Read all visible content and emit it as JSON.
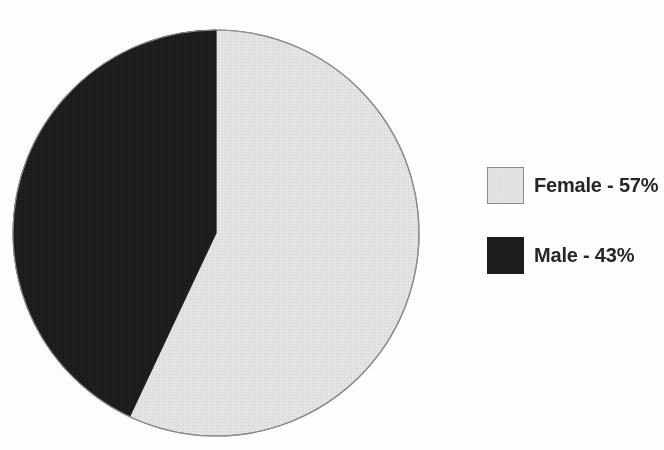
{
  "chart_data": {
    "type": "pie",
    "title": "Gender of Offenders",
    "xlabel": "",
    "ylabel": "",
    "grid": false,
    "legend_position": "right",
    "units": "percent",
    "start_angle_deg": 0,
    "direction": "clockwise",
    "categories": [
      "Female",
      "Male"
    ],
    "values": [
      57,
      43
    ],
    "slices": [
      {
        "label": "Female",
        "value": 57,
        "value_text": "57%",
        "legend_text": "Female - 57%",
        "color": "#e3e3e3",
        "border_color": "#8d8d8d",
        "start_angle_deg": 0,
        "end_angle_deg": 205.2
      },
      {
        "label": "Male",
        "value": 43,
        "value_text": "43%",
        "legend_text": "Male - 43%",
        "color": "#1d1d1d",
        "border_color": "#1d1d1d",
        "start_angle_deg": 205.2,
        "end_angle_deg": 360
      }
    ]
  },
  "figure": {
    "background": "#ffffff",
    "title": "Gender of Offenders"
  },
  "pie": {
    "center_x": 204,
    "center_y": 204,
    "radius": 203,
    "outline_color": "#8d8d8d"
  },
  "legend": {
    "items": [
      {
        "label": "Female - 57%",
        "color": "#e3e3e3",
        "swatch_name": "female"
      },
      {
        "label": "Male - 43%",
        "color": "#1d1d1d",
        "swatch_name": "male"
      }
    ]
  }
}
